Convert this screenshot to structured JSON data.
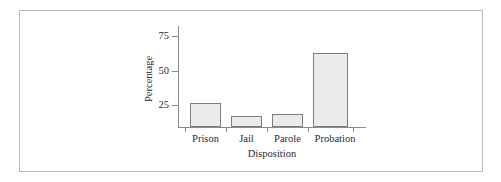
{
  "figure": {
    "background_color": "#ffffff",
    "frame_color": "#b9b9b9",
    "axis_color": "#8a8a8a"
  },
  "chart_data": {
    "type": "bar",
    "title": "",
    "subtitle": "",
    "xlabel": "Disposition",
    "ylabel": "Percentage",
    "categories": [
      "Prison",
      "Jail",
      "Parole",
      "Probation"
    ],
    "values": [
      20,
      9,
      11,
      61
    ],
    "series": [
      {
        "name": "Percentage",
        "values": [
          20,
          9,
          11,
          61
        ]
      }
    ],
    "ylim": [
      0,
      82
    ],
    "yticks": [
      25,
      50,
      75
    ],
    "ytick_labels": [
      "25",
      "50",
      "75"
    ],
    "xtick_labels": [
      "Prison",
      "Jail",
      "Parole",
      "Probation"
    ],
    "grid": false,
    "legend": null,
    "legend_position": "none",
    "bar_fill_color": "#ebebe9",
    "bar_edge_color": "#7d7d7d",
    "annotations": []
  }
}
